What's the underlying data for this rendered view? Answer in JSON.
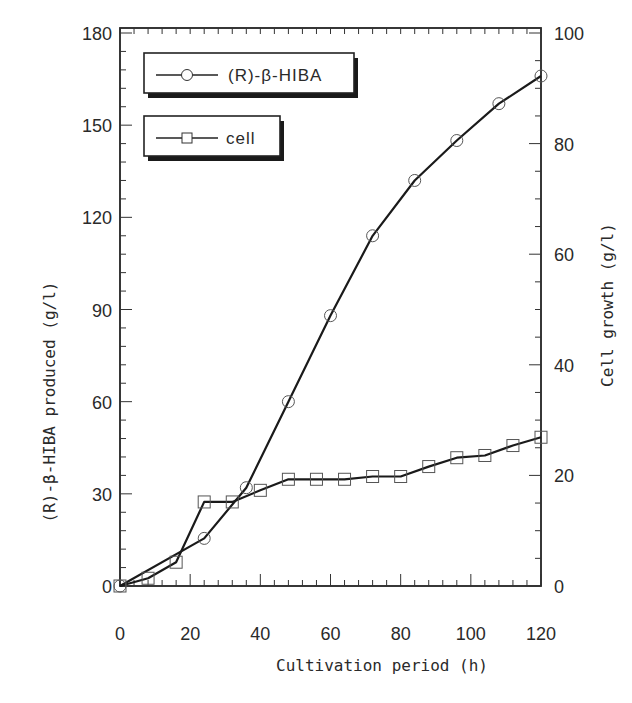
{
  "chart_data": {
    "type": "line",
    "title": "",
    "xlabel": "Cultivation period (h)",
    "ylabel_left": "(R)-β-HIBA produced (g/l)",
    "ylabel_right": "Cell growth (g/l)",
    "xlim": [
      0,
      120
    ],
    "ylim_left": [
      0,
      180
    ],
    "ylim_right": [
      0,
      100
    ],
    "x_ticks": [
      0,
      20,
      40,
      60,
      80,
      100,
      120
    ],
    "y_left_ticks": [
      0,
      30,
      60,
      90,
      120,
      150,
      180
    ],
    "y_right_ticks": [
      0,
      20,
      40,
      60,
      80,
      100
    ],
    "grid": false,
    "legend_position": "upper-left",
    "series": [
      {
        "name": "(R)-β-HIBA",
        "axis": "left",
        "marker": "circle",
        "x": [
          0,
          24,
          36,
          48,
          60,
          72,
          84,
          96,
          108,
          120
        ],
        "values": [
          0,
          15.5,
          32,
          60,
          88,
          114,
          132,
          145,
          157,
          166
        ]
      },
      {
        "name": "cell",
        "axis": "right",
        "marker": "square",
        "x": [
          0,
          8,
          16,
          24,
          32,
          40,
          48,
          56,
          64,
          72,
          80,
          88,
          96,
          104,
          112,
          120
        ],
        "values": [
          0,
          1.4,
          4.3,
          15.2,
          15.2,
          17.3,
          19.3,
          19.3,
          19.3,
          19.8,
          19.8,
          21.6,
          23.2,
          23.6,
          25.4,
          26.9
        ]
      }
    ]
  },
  "legend": {
    "hiba_label": "(R)-β-HIBA",
    "cell_label": "cell"
  },
  "axes": {
    "x_title": "Cultivation period (h)",
    "left_title": "(R)-β-HIBA produced (g/l)",
    "right_title": "Cell growth (g/l)"
  }
}
